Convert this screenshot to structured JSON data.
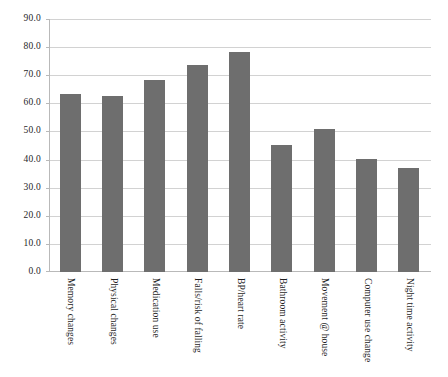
{
  "chart_data": {
    "type": "bar",
    "title": "",
    "subtitle": "",
    "xlabel": "",
    "ylabel": "",
    "ylim": [
      0.0,
      90.0
    ],
    "y_ticks": [
      "0.0",
      "10.0",
      "20.0",
      "30.0",
      "40.0",
      "50.0",
      "60.0",
      "70.0",
      "80.0",
      "90.0"
    ],
    "y_tick_values": [
      0.0,
      10.0,
      20.0,
      30.0,
      40.0,
      50.0,
      60.0,
      70.0,
      80.0,
      90.0
    ],
    "grid": true,
    "legend": "none",
    "bar_color": "#6e6e6e",
    "gridline_color": "#d2d2d2",
    "axis_color": "#b9b9b9",
    "categories": [
      "Memory changes",
      "Physical changes",
      "Medication use",
      "Falls/risk of falling",
      "BP/heart rate",
      "Bathroom activity",
      "Movement @ house",
      "Computer use change",
      "Night time activity"
    ],
    "values": [
      63.7,
      63.0,
      68.7,
      74.0,
      78.5,
      45.5,
      51.0,
      40.5,
      37.0
    ]
  }
}
